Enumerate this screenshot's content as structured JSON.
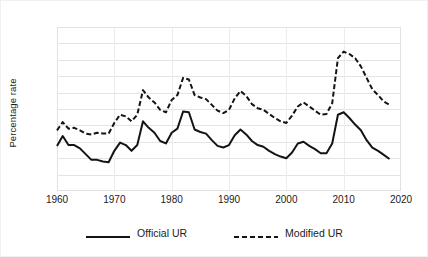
{
  "chart_data": {
    "type": "line",
    "title": "",
    "xlabel": "",
    "ylabel": "Percentage rate",
    "xlim": [
      1960,
      2020
    ],
    "ylim": [
      0,
      20
    ],
    "ytick_step": 2,
    "xtick_step": 10,
    "grid": true,
    "legend_position": "bottom",
    "xticks": [
      "1960",
      "1970",
      "1980",
      "1990",
      "2000",
      "2010",
      "2020"
    ],
    "yticks": [
      "0",
      "2",
      "4",
      "6",
      "8",
      "10",
      "12",
      "14",
      "16",
      "18",
      "20"
    ],
    "x": [
      1960,
      1961,
      1962,
      1963,
      1964,
      1965,
      1966,
      1967,
      1968,
      1969,
      1970,
      1971,
      1972,
      1973,
      1974,
      1975,
      1976,
      1977,
      1978,
      1979,
      1980,
      1981,
      1982,
      1983,
      1984,
      1985,
      1986,
      1987,
      1988,
      1989,
      1990,
      1991,
      1992,
      1993,
      1994,
      1995,
      1996,
      1997,
      1998,
      1999,
      2000,
      2001,
      2002,
      2003,
      2004,
      2005,
      2006,
      2007,
      2008,
      2009,
      2010,
      2011,
      2012,
      2013,
      2014,
      2015,
      2016,
      2017,
      2018
    ],
    "series": [
      {
        "name": "Official UR",
        "style": "solid",
        "color": "#141414",
        "values": [
          5.5,
          6.7,
          5.6,
          5.6,
          5.2,
          4.5,
          3.8,
          3.8,
          3.6,
          3.5,
          4.9,
          5.9,
          5.6,
          4.9,
          5.6,
          8.5,
          7.7,
          7.1,
          6.1,
          5.8,
          7.1,
          7.6,
          9.7,
          9.6,
          7.5,
          7.2,
          7.0,
          6.2,
          5.5,
          5.3,
          5.6,
          6.8,
          7.5,
          6.9,
          6.1,
          5.6,
          5.4,
          4.9,
          4.5,
          4.2,
          4.0,
          4.7,
          5.8,
          6.0,
          5.5,
          5.1,
          4.6,
          4.6,
          5.8,
          9.3,
          9.6,
          8.9,
          8.1,
          7.4,
          6.2,
          5.3,
          4.9,
          4.4,
          3.9
        ]
      },
      {
        "name": "Modified UR",
        "style": "dashed",
        "color": "#141414",
        "values": [
          7.4,
          8.4,
          7.6,
          7.7,
          7.4,
          7.0,
          6.9,
          7.1,
          7.0,
          7.0,
          8.3,
          9.3,
          9.1,
          8.5,
          9.3,
          12.3,
          11.4,
          10.8,
          9.9,
          9.6,
          11.1,
          11.7,
          13.8,
          13.6,
          11.7,
          11.4,
          11.2,
          10.5,
          9.8,
          9.5,
          9.9,
          11.3,
          12.2,
          11.6,
          10.6,
          10.1,
          9.9,
          9.4,
          8.9,
          8.5,
          8.3,
          9.2,
          10.3,
          10.8,
          10.3,
          9.8,
          9.3,
          9.4,
          10.7,
          16.2,
          17.0,
          16.7,
          16.2,
          15.2,
          13.8,
          12.4,
          11.7,
          10.9,
          10.5
        ]
      }
    ]
  },
  "legend": {
    "items": [
      {
        "label": "Official UR",
        "style": "solid"
      },
      {
        "label": "Modified UR",
        "style": "dashed"
      }
    ]
  }
}
